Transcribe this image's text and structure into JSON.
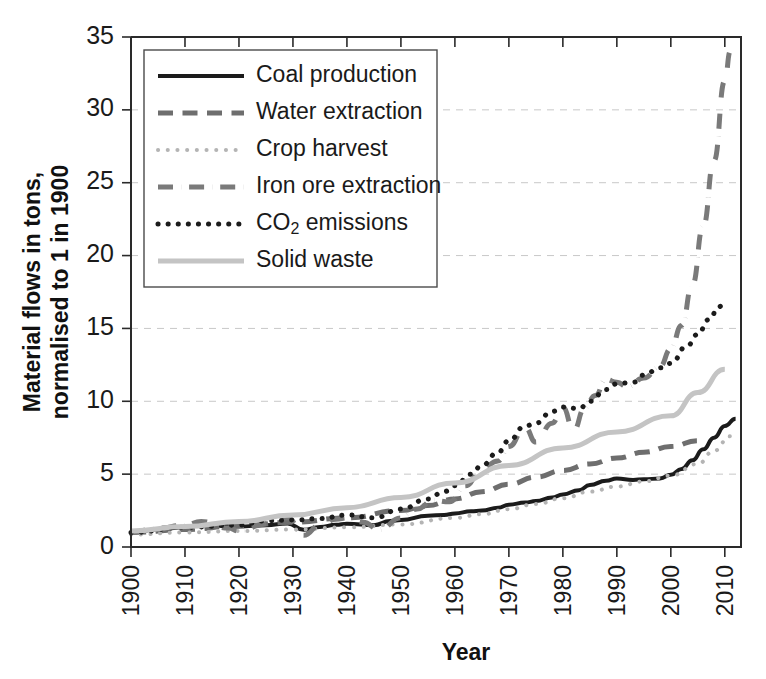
{
  "chart_data": {
    "type": "line",
    "title": "",
    "xlabel": "Year",
    "ylabel": "Material flows in tons, normalised to 1 in 1900",
    "xlim": [
      1900,
      2013
    ],
    "ylim": [
      0,
      35
    ],
    "xticks": [
      1900,
      1910,
      1920,
      1930,
      1940,
      1950,
      1960,
      1970,
      1980,
      1990,
      2000,
      2010
    ],
    "yticks": [
      0,
      5,
      10,
      15,
      20,
      25,
      30,
      35
    ],
    "grid": "horizontal-dashed",
    "legend_position": "upper-left-inside",
    "series": [
      {
        "name": "Coal production",
        "style": "solid",
        "color": "#1b1b1b",
        "width": 4,
        "x": [
          1900,
          1905,
          1910,
          1913,
          1918,
          1920,
          1925,
          1929,
          1932,
          1935,
          1938,
          1940,
          1945,
          1948,
          1950,
          1955,
          1958,
          1960,
          1963,
          1965,
          1968,
          1970,
          1973,
          1975,
          1978,
          1980,
          1983,
          1985,
          1988,
          1990,
          1993,
          1995,
          1998,
          2000,
          2002,
          2004,
          2006,
          2008,
          2010,
          2012
        ],
        "values": [
          1.0,
          1.22,
          1.35,
          1.5,
          1.45,
          1.4,
          1.5,
          1.62,
          1.18,
          1.38,
          1.52,
          1.6,
          1.5,
          1.78,
          1.85,
          2.15,
          2.2,
          2.3,
          2.45,
          2.5,
          2.7,
          2.9,
          3.05,
          3.15,
          3.4,
          3.6,
          3.9,
          4.25,
          4.55,
          4.7,
          4.6,
          4.65,
          4.7,
          4.95,
          5.35,
          5.95,
          6.7,
          7.5,
          8.3,
          8.8
        ]
      },
      {
        "name": "Water extraction",
        "style": "dashed",
        "color": "#6e6e6e",
        "width": 5,
        "x": [
          1900,
          1910,
          1920,
          1930,
          1940,
          1950,
          1955,
          1960,
          1965,
          1970,
          1975,
          1980,
          1985,
          1990,
          1995,
          2000,
          2005
        ],
        "values": [
          1.0,
          1.2,
          1.45,
          1.7,
          2.0,
          2.5,
          2.85,
          3.3,
          3.8,
          4.3,
          4.8,
          5.25,
          5.7,
          6.1,
          6.5,
          6.9,
          7.3
        ]
      },
      {
        "name": "Crop harvest",
        "style": "fine-dotted",
        "color": "#b4b4b4",
        "width": 4,
        "x": [
          1900,
          1910,
          1920,
          1930,
          1940,
          1950,
          1960,
          1965,
          1970,
          1975,
          1980,
          1985,
          1990,
          1995,
          2000,
          2005,
          2008,
          2011
        ],
        "values": [
          0.85,
          1.0,
          1.1,
          1.2,
          1.35,
          1.55,
          2.0,
          2.25,
          2.6,
          2.95,
          3.35,
          3.8,
          4.15,
          4.5,
          4.9,
          5.7,
          6.6,
          7.6
        ]
      },
      {
        "name": "Iron ore extraction",
        "style": "dash-dot",
        "color": "#7a7a7a",
        "width": 5,
        "x": [
          1900,
          1905,
          1910,
          1913,
          1918,
          1920,
          1925,
          1929,
          1932,
          1935,
          1938,
          1940,
          1943,
          1946,
          1950,
          1953,
          1956,
          1959,
          1962,
          1965,
          1968,
          1970,
          1973,
          1975,
          1978,
          1980,
          1982,
          1984,
          1986,
          1988,
          1990,
          1992,
          1995,
          1998,
          2000,
          2002,
          2004,
          2006,
          2008,
          2010,
          2011
        ],
        "values": [
          1.0,
          1.3,
          1.5,
          1.75,
          1.3,
          1.1,
          1.6,
          2.0,
          0.8,
          1.5,
          1.9,
          2.0,
          1.7,
          1.2,
          2.0,
          2.6,
          3.2,
          3.1,
          4.2,
          5.4,
          5.9,
          6.9,
          8.2,
          7.2,
          8.5,
          9.6,
          8.0,
          9.5,
          10.4,
          11.5,
          11.3,
          11.0,
          11.6,
          12.4,
          13.6,
          15.2,
          18.0,
          22.0,
          26.5,
          32.0,
          34.0
        ]
      },
      {
        "name": "CO2 emissions",
        "style": "dotted",
        "color": "#1b1b1b",
        "width": 5,
        "x": [
          1900,
          1910,
          1920,
          1925,
          1930,
          1935,
          1940,
          1945,
          1950,
          1955,
          1958,
          1960,
          1963,
          1965,
          1968,
          1970,
          1973,
          1975,
          1978,
          1980,
          1983,
          1985,
          1988,
          1990,
          1993,
          1995,
          1998,
          2000,
          2003,
          2005,
          2007,
          2009,
          2010
        ],
        "values": [
          1.0,
          1.35,
          1.5,
          1.8,
          1.85,
          1.95,
          2.2,
          2.0,
          2.6,
          3.3,
          3.8,
          4.2,
          5.0,
          5.6,
          6.5,
          7.3,
          8.3,
          8.5,
          9.3,
          9.6,
          9.5,
          10.0,
          10.8,
          11.2,
          11.3,
          11.8,
          12.3,
          12.6,
          13.8,
          14.6,
          15.6,
          16.5,
          17.0
        ]
      },
      {
        "name": "Solid waste",
        "style": "solid",
        "color": "#c4c4c4",
        "width": 5,
        "x": [
          1900,
          1910,
          1920,
          1930,
          1940,
          1950,
          1960,
          1970,
          1980,
          1990,
          2000,
          2005,
          2010
        ],
        "values": [
          1.1,
          1.4,
          1.75,
          2.2,
          2.7,
          3.4,
          4.4,
          5.6,
          6.8,
          7.9,
          9.0,
          10.6,
          12.2
        ]
      }
    ]
  },
  "legend": {
    "items": [
      {
        "label": "Coal production",
        "sub": ""
      },
      {
        "label": "Water extraction",
        "sub": ""
      },
      {
        "label": "Crop harvest",
        "sub": ""
      },
      {
        "label": "Iron ore extraction",
        "sub": ""
      },
      {
        "label": "CO",
        "sub": "2",
        "tail": " emissions"
      },
      {
        "label": "Solid waste",
        "sub": ""
      }
    ]
  },
  "axis": {
    "y_title_line1": "Material flows in tons,",
    "y_title_line2": "normalised to 1 in 1900",
    "x_title": "Year"
  }
}
